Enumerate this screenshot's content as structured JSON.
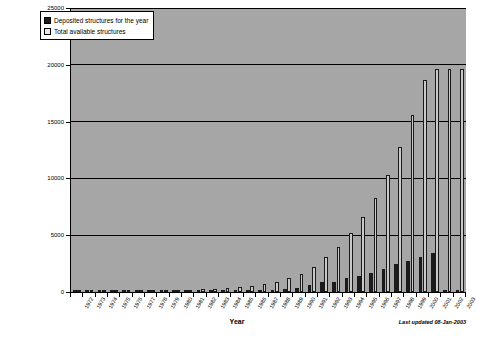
{
  "chart_data": {
    "type": "bar",
    "title": "",
    "xlabel": "Year",
    "ylabel": "",
    "ylim": [
      0,
      25000
    ],
    "yticks": [
      0,
      5000,
      10000,
      15000,
      20000,
      25000
    ],
    "grid": true,
    "legend_position": "top-left",
    "categories": [
      "1972",
      "1973",
      "1974",
      "1975",
      "1976",
      "1977",
      "1978",
      "1979",
      "1980",
      "1981",
      "1982",
      "1983",
      "1984",
      "1985",
      "1986",
      "1987",
      "1988",
      "1989",
      "1990",
      "1991",
      "1992",
      "1993",
      "1994",
      "1995",
      "1996",
      "1997",
      "1998",
      "1999",
      "2000",
      "2001",
      "2002",
      "2003"
    ],
    "series": [
      {
        "name": "Deposited structures for the year",
        "color": "#1c1c1c",
        "values": [
          8,
          5,
          11,
          13,
          16,
          23,
          23,
          27,
          23,
          46,
          55,
          56,
          60,
          75,
          99,
          181,
          187,
          292,
          379,
          627,
          852,
          916,
          1244,
          1372,
          1700,
          2046,
          2468,
          2763,
          3085,
          3395,
          30,
          0
        ]
      },
      {
        "name": "Total available structures",
        "color": "#c9c9c9",
        "values": [
          8,
          13,
          24,
          37,
          53,
          76,
          99,
          126,
          149,
          195,
          250,
          306,
          366,
          441,
          540,
          721,
          908,
          1200,
          1579,
          2206,
          3058,
          3974,
          5218,
          6590,
          8290,
          10336,
          12804,
          15567,
          18652,
          19595,
          19625,
          19650
        ]
      }
    ],
    "annotation": "Last updated  08-Jan-2003"
  },
  "legend": {
    "items": [
      {
        "label": "Deposited structures for the year",
        "swatch": "dark"
      },
      {
        "label": "Total available structures",
        "swatch": "light"
      }
    ]
  },
  "axis": {
    "x_title": "Year"
  }
}
